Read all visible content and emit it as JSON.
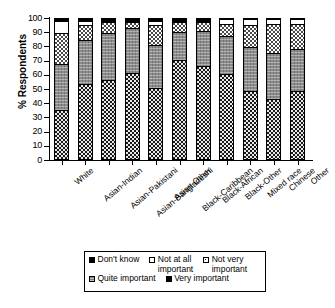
{
  "chart_data": {
    "type": "bar",
    "subtype": "100% stacked bar",
    "title": "",
    "xlabel": "",
    "ylabel": "% Respondents",
    "ylim": [
      0,
      100
    ],
    "yticks": [
      0,
      10,
      20,
      30,
      40,
      50,
      60,
      70,
      80,
      90,
      100
    ],
    "grid": false,
    "legend_position": "bottom",
    "categories": [
      "White",
      "Asian-Indian",
      "Asian-Pakistani",
      "Asian-Bangladeshi",
      "Asian-Other",
      "Black-Caribbean",
      "Black-African",
      "Black-Other",
      "Mixed race",
      "Chinese",
      "Other"
    ],
    "series": [
      {
        "name": "Very important",
        "pattern": "dark-checkered",
        "values": [
          34,
          53,
          56,
          61,
          50,
          70,
          66,
          60,
          48,
          42,
          48
        ]
      },
      {
        "name": "Quite important",
        "pattern": "medium-gray",
        "values": [
          33,
          31,
          33,
          32,
          31,
          20,
          25,
          27,
          31,
          33,
          30
        ]
      },
      {
        "name": "Not very important",
        "pattern": "light-dotted",
        "values": [
          22,
          11,
          8,
          4,
          14,
          7,
          6,
          9,
          16,
          21,
          18
        ]
      },
      {
        "name": "Not at all important",
        "pattern": "white",
        "values": [
          9,
          3,
          1,
          1,
          3,
          1,
          1,
          3,
          4,
          3,
          3
        ]
      },
      {
        "name": "Don't know",
        "pattern": "solid-black",
        "values": [
          2,
          2,
          2,
          2,
          2,
          2,
          2,
          1,
          1,
          1,
          1
        ]
      }
    ]
  },
  "legend": {
    "entries": [
      {
        "label": "Don't know",
        "pattern": "solid-black"
      },
      {
        "label": "Not at all\nimportant",
        "pattern": "white"
      },
      {
        "label": "Not very\nimportant",
        "pattern": "light-dotted"
      },
      {
        "label": "Quite important",
        "pattern": "medium-gray"
      },
      {
        "label": "Very important",
        "pattern": "dark-checkered"
      }
    ]
  }
}
